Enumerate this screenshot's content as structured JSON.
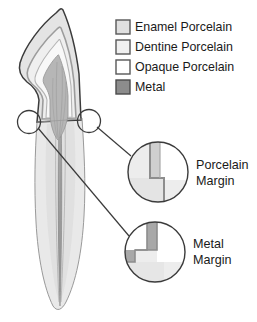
{
  "figure": {
    "background_color": "#ffffff",
    "outline_color": "#3b3b3b"
  },
  "legend": {
    "items": [
      {
        "label": "Enamel Porcelain",
        "swatch_fill": "#e0e0e0",
        "swatch_stroke": "#575757",
        "icon": "square-swatch-icon"
      },
      {
        "label": "Dentine Porcelain",
        "swatch_fill": "#f0f0f0",
        "swatch_stroke": "#575757",
        "icon": "square-swatch-icon"
      },
      {
        "label": "Opaque Porcelain",
        "swatch_fill": "#ffffff",
        "swatch_stroke": "#575757",
        "icon": "square-swatch-icon"
      },
      {
        "label": "Metal",
        "swatch_fill": "#8c8c8c",
        "swatch_stroke": "#4a4a4a",
        "icon": "square-swatch-icon"
      }
    ]
  },
  "tooth": {
    "name": "anterior tooth cross-section",
    "crown_outline_color": "#3b3b3b",
    "enamel_fill": "#e3e3e3",
    "dentine_fill": "#efefef",
    "opaque_fill": "#fafafa",
    "core_fill": "#b4b4b4",
    "root_fill": "#e8e8e8",
    "canal_color": "#7d7d7d"
  },
  "callouts": [
    {
      "id": "porcelain-margin",
      "label_line1": "Porcelain",
      "label_line2": "Margin",
      "circle_fill": "#ededed",
      "circle_stroke": "#3b3b3b",
      "step_fill": "#ffffff",
      "band_fill": "#cfcfcf"
    },
    {
      "id": "metal-margin",
      "label_line1": "Metal",
      "label_line2": "Margin",
      "circle_fill": "#ededed",
      "circle_stroke": "#3b3b3b",
      "step_fill": "#ffffff",
      "band_fill": "#a8a8a8"
    }
  ],
  "markers": {
    "left_circle_name": "metal-margin-locator",
    "right_circle_name": "porcelain-margin-locator",
    "stroke": "#3b3b3b"
  }
}
